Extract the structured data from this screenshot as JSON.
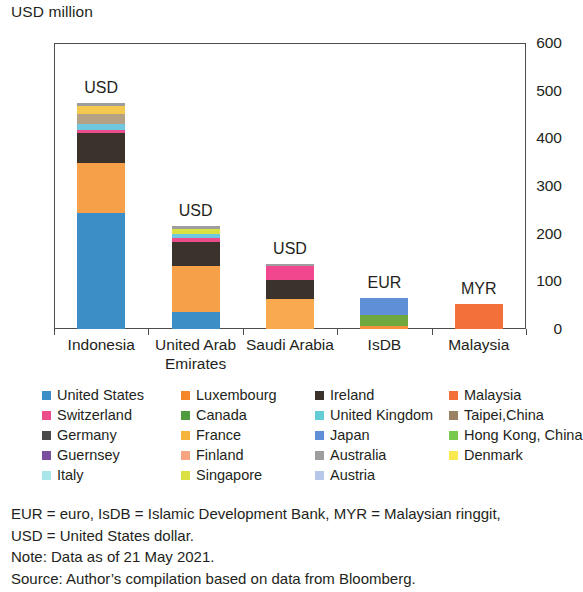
{
  "axis_unit_title": "USD million",
  "chart_data": {
    "type": "bar",
    "subtype": "stacked-bar",
    "title": "",
    "xlabel": "",
    "ylabel": "USD million",
    "ylim": [
      0,
      600
    ],
    "yticks": [
      0,
      100,
      200,
      300,
      400,
      500,
      600
    ],
    "ytick_labels": [
      "0",
      "100",
      "200",
      "300",
      "400",
      "500",
      "600"
    ],
    "grid": false,
    "legend_position": "below",
    "categories": [
      "Indonesia",
      "United Arab Emirates",
      "Saudi Arabia",
      "IsDB",
      "Malaysia"
    ],
    "category_labels": [
      [
        "Indonesia"
      ],
      [
        "United Arab",
        "Emirates"
      ],
      [
        "Saudi Arabia"
      ],
      [
        "IsDB"
      ],
      [
        "Malaysia"
      ]
    ],
    "bar_annotations": [
      "USD",
      "USD",
      "USD",
      "EUR",
      "MYR"
    ],
    "totals": [
      475,
      217,
      137,
      65,
      52
    ],
    "series": [
      {
        "name": "United States",
        "color": "#3b8ec6",
        "values": [
          243,
          35,
          0,
          0,
          0
        ]
      },
      {
        "name": "Luxembourg",
        "color": "#f6862a",
        "values": [
          0,
          0,
          0,
          0,
          0
        ]
      },
      {
        "name": "Ireland",
        "color": "#3a322b",
        "values": [
          0,
          0,
          0,
          0,
          0
        ]
      },
      {
        "name": "Malaysia",
        "color": "#f4703a",
        "values": [
          0,
          0,
          0,
          0,
          52
        ]
      },
      {
        "name": "Switzerland",
        "color": "#ec4d8a",
        "values": [
          7,
          7,
          16,
          0,
          0
        ]
      },
      {
        "name": "Canada",
        "color": "#4f9c3f",
        "values": [
          0,
          0,
          0,
          19,
          0
        ]
      },
      {
        "name": "United Kingdom",
        "color": "#62cdd4",
        "values": [
          12,
          7,
          0,
          0,
          0
        ]
      },
      {
        "name": "Taipei,China",
        "color": "#9a8263",
        "values": [
          22,
          0,
          0,
          0,
          0
        ]
      },
      {
        "name": "Germany",
        "color": "#4a4a4a",
        "values": [
          0,
          0,
          4,
          0,
          0
        ]
      },
      {
        "name": "France",
        "color": "#f6b43c",
        "values": [
          0,
          0,
          0,
          0,
          0
        ]
      },
      {
        "name": "Japan",
        "color": "#5f8fd6",
        "values": [
          0,
          0,
          0,
          40,
          0
        ]
      },
      {
        "name": "Hong Kong, China",
        "color": "#77c94e",
        "values": [
          0,
          0,
          0,
          0,
          0
        ]
      },
      {
        "name": "Guernsey",
        "color": "#7b4fa0",
        "values": [
          0,
          0,
          0,
          0,
          0
        ]
      },
      {
        "name": "Finland",
        "color": "#f7a580",
        "values": [
          0,
          0,
          0,
          0,
          0
        ]
      },
      {
        "name": "Australia",
        "color": "#9e9e9e",
        "values": [
          0,
          0,
          3,
          0,
          0
        ]
      },
      {
        "name": "Denmark",
        "color": "#f9e94e",
        "values": [
          16,
          0,
          0,
          0,
          0
        ]
      },
      {
        "name": "Italy",
        "color": "#a8e6ea",
        "values": [
          0,
          0,
          0,
          0,
          0
        ]
      },
      {
        "name": "Singapore",
        "color": "#dbe043",
        "values": [
          0,
          9,
          0,
          0,
          0
        ]
      },
      {
        "name": "Austria",
        "color": "#b6c7ea",
        "values": [
          0,
          0,
          0,
          0,
          0
        ]
      }
    ],
    "stacks": [
      {
        "category": "Indonesia",
        "segments": [
          {
            "name": "United States",
            "value": 243,
            "color": "#3b8ec6"
          },
          {
            "name": "Luxembourg",
            "value": 106,
            "color": "#f6a04a"
          },
          {
            "name": "Ireland",
            "value": 62,
            "color": "#3a322b"
          },
          {
            "name": "Switzerland",
            "value": 7,
            "color": "#ec4d8a"
          },
          {
            "name": "United Kingdom",
            "value": 12,
            "color": "#6fc7e0"
          },
          {
            "name": "Taipei,China",
            "value": 22,
            "color": "#b5a285"
          },
          {
            "name": "Denmark",
            "value": 16,
            "color": "#f5c84f"
          },
          {
            "name": "Australia",
            "value": 7,
            "color": "#9e9e9e"
          }
        ]
      },
      {
        "category": "United Arab Emirates",
        "segments": [
          {
            "name": "United States",
            "value": 35,
            "color": "#3b8ec6"
          },
          {
            "name": "Luxembourg",
            "value": 97,
            "color": "#f6a04a"
          },
          {
            "name": "Ireland",
            "value": 50,
            "color": "#3a322b"
          },
          {
            "name": "Switzerland",
            "value": 9,
            "color": "#ec4d8a"
          },
          {
            "name": "United Kingdom",
            "value": 8,
            "color": "#6fc7e0"
          },
          {
            "name": "Singapore",
            "value": 11,
            "color": "#dbe043"
          },
          {
            "name": "Australia",
            "value": 7,
            "color": "#9e9e9e"
          }
        ]
      },
      {
        "category": "Saudi Arabia",
        "segments": [
          {
            "name": "Malaysia",
            "value": 62,
            "color": "#f9a94e"
          },
          {
            "name": "Ireland",
            "value": 40,
            "color": "#3a322b"
          },
          {
            "name": "Switzerland",
            "value": 30,
            "color": "#f0478e"
          },
          {
            "name": "Australia",
            "value": 5,
            "color": "#9e9e9e"
          }
        ]
      },
      {
        "category": "IsDB",
        "segments": [
          {
            "name": "Malaysia",
            "value": 6,
            "color": "#f4923b"
          },
          {
            "name": "Canada",
            "value": 24,
            "color": "#6fa83f"
          },
          {
            "name": "Japan",
            "value": 35,
            "color": "#5f8fd6"
          }
        ]
      },
      {
        "category": "Malaysia",
        "segments": [
          {
            "name": "Malaysia",
            "value": 52,
            "color": "#f4703a"
          }
        ]
      }
    ]
  },
  "legend": {
    "rows": [
      [
        {
          "label": "United States",
          "color": "#3b8ec6"
        },
        {
          "label": "Luxembourg",
          "color": "#f6862a"
        },
        {
          "label": "Ireland",
          "color": "#3a322b"
        },
        {
          "label": "Malaysia",
          "color": "#f4703a"
        }
      ],
      [
        {
          "label": "Switzerland",
          "color": "#ec4d8a"
        },
        {
          "label": "Canada",
          "color": "#4f9c3f"
        },
        {
          "label": "United Kingdom",
          "color": "#62cdd4"
        },
        {
          "label": "Taipei,China",
          "color": "#9a8263"
        }
      ],
      [
        {
          "label": "Germany",
          "color": "#4a4a4a"
        },
        {
          "label": "France",
          "color": "#f6b43c"
        },
        {
          "label": "Japan",
          "color": "#5f8fd6"
        },
        {
          "label": "Hong Kong, China",
          "color": "#77c94e"
        }
      ],
      [
        {
          "label": "Guernsey",
          "color": "#7b4fa0"
        },
        {
          "label": "Finland",
          "color": "#f7a580"
        },
        {
          "label": "Australia",
          "color": "#9e9e9e"
        },
        {
          "label": "Denmark",
          "color": "#f9e94e"
        }
      ],
      [
        {
          "label": "Italy",
          "color": "#a8e6ea"
        },
        {
          "label": "Singapore",
          "color": "#dbe043"
        },
        {
          "label": "Austria",
          "color": "#b6c7ea"
        }
      ]
    ]
  },
  "footnotes": [
    "EUR = euro, IsDB = Islamic Development Bank, MYR = Malaysian ringgit,",
    "USD = United States dollar.",
    "Note: Data as of 21 May 2021.",
    "Source: Author’s compilation based on data from Bloomberg."
  ]
}
